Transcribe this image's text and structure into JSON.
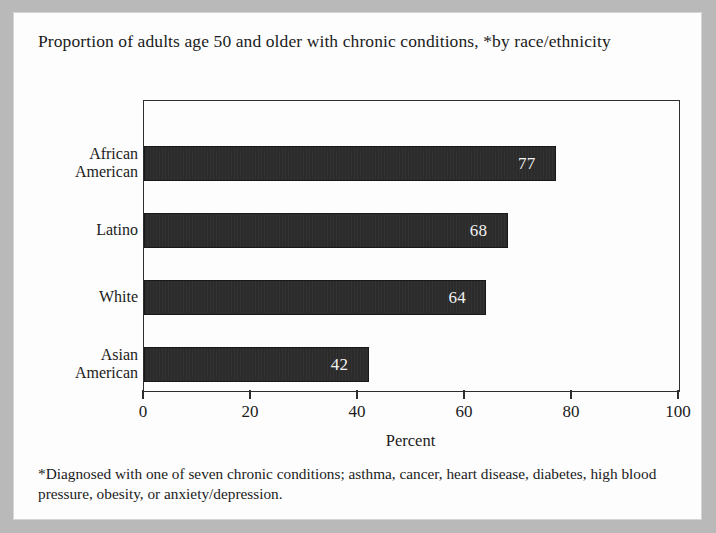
{
  "figure": {
    "title": "Proportion of adults age 50 and older with chronic conditions, *by race/ethnicity",
    "footnote": "*Diagnosed with one of seven chronic conditions; asthma, cancer, heart disease, diabetes, high blood pressure, obesity, or anxiety/depression.",
    "bar_color": "#2b2b2b",
    "value_label_color": "#f2f2f2",
    "axis_color": "#2e2e2e",
    "paper_color": "#fdfdfd",
    "surround_color": "#b9b9b9"
  },
  "chart_data": {
    "type": "bar",
    "orientation": "horizontal",
    "title": "Proportion of adults age 50 and older with chronic conditions, *by race/ethnicity",
    "categories": [
      "African American",
      "Latino",
      "White",
      "Asian American"
    ],
    "values": [
      77,
      68,
      64,
      42
    ],
    "data_labels": [
      "77",
      "68",
      "64",
      "42"
    ],
    "xlabel": "Percent",
    "ylabel": "",
    "xlim": [
      0,
      100
    ],
    "xticks": [
      0,
      20,
      40,
      60,
      80,
      100
    ],
    "xtick_labels": [
      "0",
      "20",
      "40",
      "60",
      "80",
      "100"
    ],
    "grid": false,
    "legend": false,
    "series": [
      {
        "name": "Percent with chronic conditions",
        "values": [
          77,
          68,
          64,
          42
        ]
      }
    ]
  }
}
